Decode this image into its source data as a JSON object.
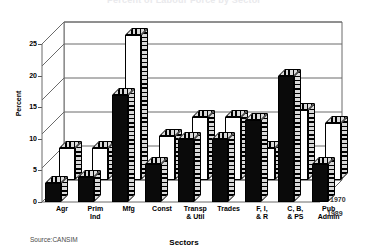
{
  "chart_data": {
    "type": "bar",
    "title": "Percent of Labour Force by Sector",
    "xlabel": "Sectors",
    "ylabel": "Percent",
    "ylim": [
      0,
      25
    ],
    "yticks": [
      0,
      5,
      10,
      15,
      20,
      25
    ],
    "grid": true,
    "legend_position": "right",
    "source": "Source:CANSIM",
    "categories": [
      "Agr",
      "Prim\nInd",
      "Mfg",
      "Const",
      "Transp\n& Util",
      "Trades",
      "F, I,\n& R",
      "C, B,\n& PS",
      "Pub\nAdmin"
    ],
    "category_lines": [
      [
        "Agr",
        ""
      ],
      [
        "Prim",
        "Ind"
      ],
      [
        "Mfg",
        ""
      ],
      [
        "Const",
        ""
      ],
      [
        "Transp",
        "& Util"
      ],
      [
        "Trades",
        ""
      ],
      [
        "F, I,",
        "& R"
      ],
      [
        "C, B,",
        "& PS"
      ],
      [
        "Pub",
        "Admin"
      ]
    ],
    "series": [
      {
        "name": "1970",
        "values": [
          5,
          5,
          23,
          7,
          10,
          10,
          5,
          11,
          9
        ]
      },
      {
        "name": "1989",
        "values": [
          3,
          4,
          17,
          6,
          10,
          10,
          13,
          20,
          6
        ]
      }
    ]
  },
  "legend": {
    "back_label": "1970",
    "front_label": "1989"
  }
}
